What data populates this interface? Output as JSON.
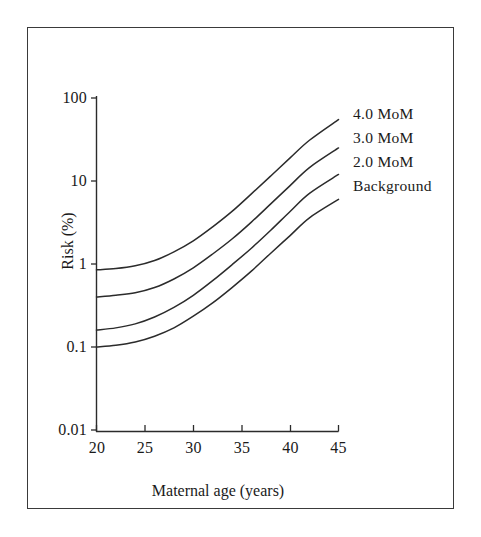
{
  "figure": {
    "background_color": "#ffffff",
    "frame_color": "#3a3a3a",
    "line_color": "#2b2b2b"
  },
  "chart_data": {
    "type": "line",
    "title": "",
    "xlabel": "Maternal age (years)",
    "ylabel": "Risk (%)",
    "yscale": "log",
    "xlim": [
      20,
      45
    ],
    "ylim": [
      0.01,
      100
    ],
    "grid": false,
    "legend_position": "right-inline-labels",
    "xticks": [
      20,
      25,
      30,
      35,
      40,
      45
    ],
    "xtick_labels": [
      "20",
      "25",
      "30",
      "35",
      "40",
      "45"
    ],
    "yticks": [
      0.01,
      0.1,
      1,
      10,
      100
    ],
    "ytick_labels": [
      "0.01",
      "0.1",
      "1",
      "10",
      "100"
    ],
    "x": [
      20,
      22,
      24,
      26,
      28,
      30,
      32,
      34,
      36,
      38,
      40,
      42,
      45
    ],
    "series": [
      {
        "name": "4.0 MoM",
        "label": "4.0  MoM",
        "values": [
          0.85,
          0.88,
          0.95,
          1.1,
          1.4,
          1.9,
          2.8,
          4.3,
          7.0,
          11.5,
          19.0,
          31.0,
          55.0
        ]
      },
      {
        "name": "3.0 MoM",
        "label": "3.0  MoM",
        "values": [
          0.4,
          0.42,
          0.45,
          0.52,
          0.66,
          0.9,
          1.32,
          2.0,
          3.2,
          5.3,
          8.8,
          14.5,
          25.0
        ]
      },
      {
        "name": "2.0 MoM",
        "label": "2.0  MoM",
        "values": [
          0.16,
          0.17,
          0.19,
          0.23,
          0.3,
          0.42,
          0.63,
          0.98,
          1.55,
          2.55,
          4.3,
          7.1,
          12.0
        ]
      },
      {
        "name": "Background",
        "label": "Background",
        "values": [
          0.1,
          0.105,
          0.115,
          0.135,
          0.17,
          0.235,
          0.34,
          0.52,
          0.82,
          1.35,
          2.2,
          3.6,
          6.0
        ]
      }
    ]
  },
  "axes": {
    "y_title": "Risk (%)",
    "x_title": "Maternal age (years)",
    "ytick_0": "100",
    "ytick_1": "10",
    "ytick_2": "1",
    "ytick_3": "0.1",
    "ytick_4": "0.01",
    "xtick_0": "20",
    "xtick_1": "25",
    "xtick_2": "30",
    "xtick_3": "35",
    "xtick_4": "40",
    "xtick_5": "45"
  },
  "series_labels": {
    "s0": "4.0  MoM",
    "s1": "3.0  MoM",
    "s2": "2.0  MoM",
    "s3": "Background"
  }
}
